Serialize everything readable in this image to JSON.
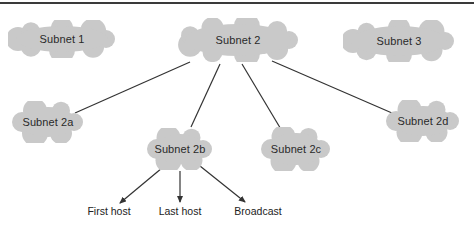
{
  "diagram": {
    "type": "subnet-hierarchy",
    "colors": {
      "cloud_fill": "#c9c9c9",
      "line": "#333333",
      "text": "#2a2a2a",
      "top_rule": "#3a3a3a"
    },
    "clouds": [
      {
        "id": "subnet1",
        "label": "Subnet 1",
        "x": 8,
        "y": 20,
        "w": 108,
        "h": 38
      },
      {
        "id": "subnet2",
        "label": "Subnet 2",
        "x": 177,
        "y": 18,
        "w": 122,
        "h": 44
      },
      {
        "id": "subnet3",
        "label": "Subnet 3",
        "x": 343,
        "y": 20,
        "w": 112,
        "h": 42
      },
      {
        "id": "subnet2a",
        "label": "Subnet 2a",
        "x": 12,
        "y": 101,
        "w": 72,
        "h": 42
      },
      {
        "id": "subnet2b",
        "label": "Subnet 2b",
        "x": 147,
        "y": 128,
        "w": 66,
        "h": 42
      },
      {
        "id": "subnet2c",
        "label": "Subnet 2c",
        "x": 261,
        "y": 127,
        "w": 70,
        "h": 44
      },
      {
        "id": "subnet2d",
        "label": "Subnet 2d",
        "x": 386,
        "y": 100,
        "w": 74,
        "h": 42
      }
    ],
    "edges": [
      {
        "from": "subnet2",
        "to": "subnet2a",
        "x1": 190,
        "y1": 62,
        "x2": 75,
        "y2": 113
      },
      {
        "from": "subnet2",
        "to": "subnet2b",
        "x1": 220,
        "y1": 64,
        "x2": 191,
        "y2": 127
      },
      {
        "from": "subnet2",
        "to": "subnet2c",
        "x1": 242,
        "y1": 64,
        "x2": 282,
        "y2": 131
      },
      {
        "from": "subnet2",
        "to": "subnet2d",
        "x1": 272,
        "y1": 61,
        "x2": 392,
        "y2": 113
      }
    ],
    "arrows": [
      {
        "from": "subnet2b",
        "to": "first_host",
        "x1": 162,
        "y1": 168,
        "x2": 120,
        "y2": 203
      },
      {
        "from": "subnet2b",
        "to": "last_host",
        "x1": 180,
        "y1": 171,
        "x2": 180,
        "y2": 202
      },
      {
        "from": "subnet2b",
        "to": "broadcast",
        "x1": 200,
        "y1": 166,
        "x2": 245,
        "y2": 202
      }
    ],
    "hosts": [
      {
        "id": "first_host",
        "label": "First host",
        "x": 109,
        "y": 205
      },
      {
        "id": "last_host",
        "label": "Last host",
        "x": 180,
        "y": 205
      },
      {
        "id": "broadcast",
        "label": "Broadcast",
        "x": 258,
        "y": 205
      }
    ]
  }
}
